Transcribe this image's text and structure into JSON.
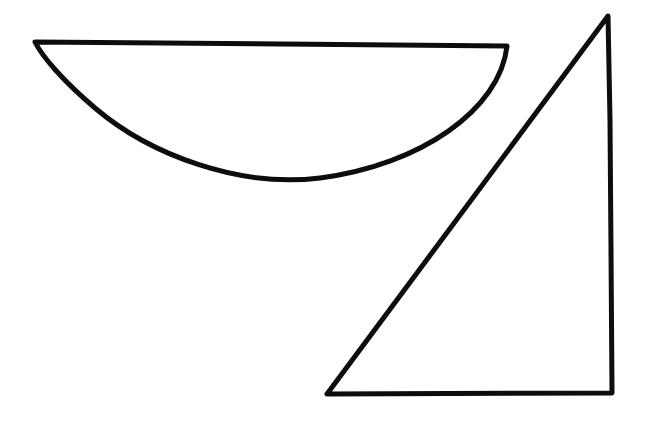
{
  "canvas": {
    "width": 646,
    "height": 422,
    "background_color": "#ffffff",
    "title": "Hand-drawn shapes"
  },
  "style": {
    "stroke_color": "#0d0d0d",
    "stroke_width": 5,
    "fill": "none",
    "line_cap": "round",
    "line_join": "round"
  },
  "shapes": [
    {
      "id": "semicircle-bowl",
      "name": "half-disc",
      "description": "Bowl shape: straight chord across the top with a downward curving arc beneath",
      "stroke_width": 5,
      "stroke_color": "#0d0d0d",
      "vertices": {
        "left_top": [
          35,
          42
        ],
        "right_top": [
          507,
          46
        ],
        "lowest_point": [
          265,
          181
        ]
      },
      "path": "M 35 42 L 507 46 C 500 110 420 165 320 178 C 240 188 150 155 95 108 C 62 80 42 56 35 42 Z"
    },
    {
      "id": "right-triangle",
      "name": "triangle",
      "description": "Right triangle with near-vertical right edge, apex at top right and a long hypotenuse down to the bottom left",
      "stroke_width": 5,
      "stroke_color": "#0d0d0d",
      "vertices": {
        "apex_top": [
          608,
          16
        ],
        "bottom_left": [
          327,
          394
        ],
        "bottom_right": [
          612,
          393
        ]
      },
      "path": "M 608 16 L 327 394 L 612 393 L 611 250 L 610 120 Z"
    }
  ]
}
